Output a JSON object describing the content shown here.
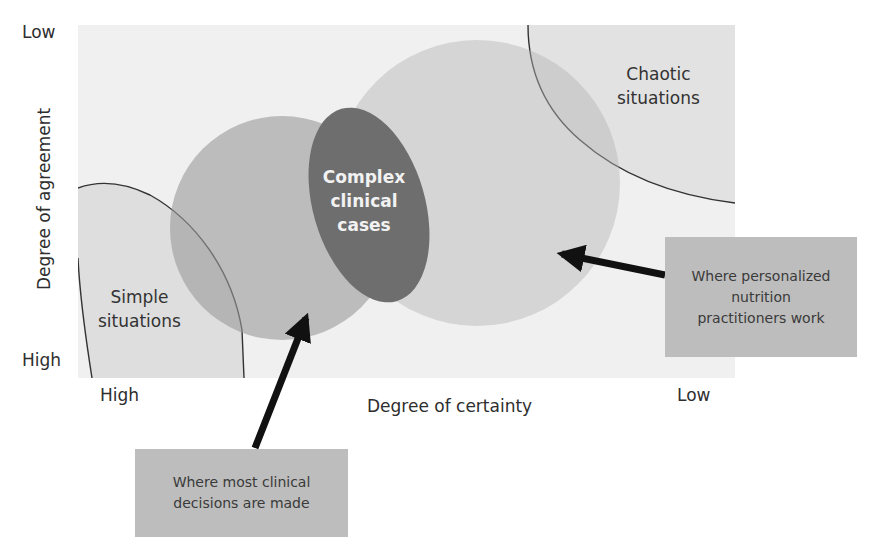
{
  "y_axis": {
    "title": "Degree of agreement",
    "top_label": "Low",
    "bottom_label": "High"
  },
  "x_axis": {
    "title": "Degree of certainty",
    "left_label": "High",
    "right_label": "Low"
  },
  "regions": {
    "simple": [
      "Simple",
      "situations"
    ],
    "chaotic": [
      "Chaotic",
      "situations"
    ],
    "complex": [
      "Complex",
      "clinical",
      "cases"
    ]
  },
  "callouts": {
    "clinical_decisions": [
      "Where most clinical",
      "decisions are made"
    ],
    "personalized_nutrition": [
      "Where personalized",
      "nutrition",
      "practitioners work"
    ]
  },
  "colors": {
    "background_zone": "#f0f0f0",
    "simple_fill": "#dedede",
    "chaotic_fill": "#e2e2e2",
    "left_circle": "#b9b9b9",
    "large_circle": "#d4d4d4",
    "ellipse": "#6e6e6e",
    "callout_box": "#bdbdbd",
    "arrow": "#111111"
  }
}
